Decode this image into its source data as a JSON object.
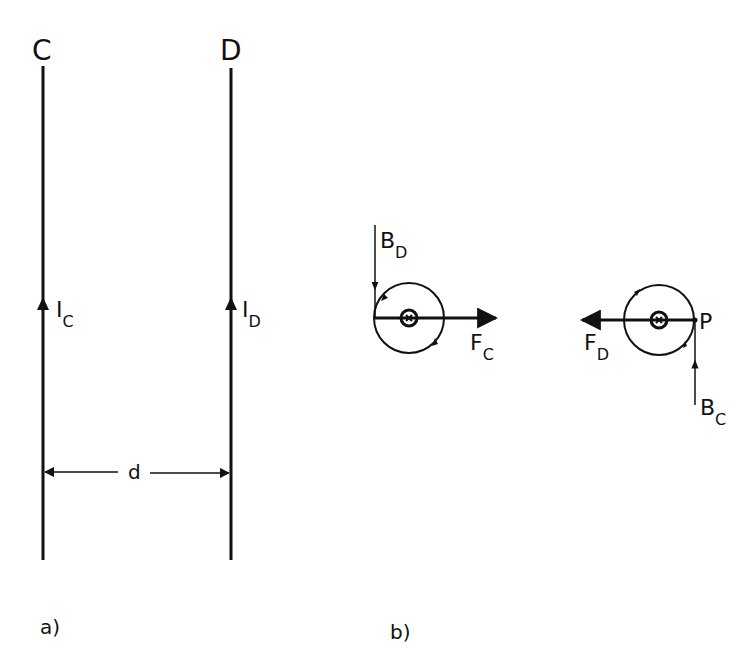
{
  "diagram": {
    "panel_a": {
      "label": "a)",
      "wire_c": {
        "name": "C",
        "current_label": "I",
        "current_sub": "C"
      },
      "wire_d": {
        "name": "D",
        "current_label": "I",
        "current_sub": "D"
      },
      "separation_label": "d"
    },
    "panel_b": {
      "label": "b)",
      "left": {
        "field_label": "B",
        "field_sub": "D",
        "force_label": "F",
        "force_sub": "C",
        "current_symbol": "into-page"
      },
      "right": {
        "point_label": "P",
        "field_label": "B",
        "field_sub": "C",
        "force_label": "F",
        "force_sub": "D",
        "current_symbol": "into-page"
      }
    },
    "colors": {
      "ink": "#111111",
      "background": "#ffffff"
    }
  }
}
